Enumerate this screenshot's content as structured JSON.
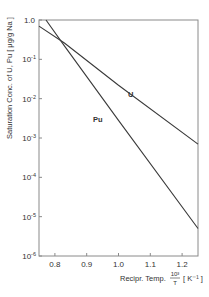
{
  "chart_data": {
    "type": "line",
    "title": "",
    "xlabel": "Recipr. Temp. 10³/T [ K⁻¹ ]",
    "xlabel_parts": {
      "prefix": "Recipr. Temp.",
      "frac_num": "10³",
      "frac_den": "T",
      "unit": "[ K⁻¹ ]"
    },
    "ylabel": "Saturation Conc. of U, Pu [ μg/g Na ]",
    "yscale": "log",
    "xlim": [
      0.75,
      1.25
    ],
    "ylim": [
      1e-06,
      1.0
    ],
    "grid": false,
    "legend": "inline labels",
    "x_ticks": [
      {
        "value": 0.8,
        "label": "0.8"
      },
      {
        "value": 0.9,
        "label": "0.9"
      },
      {
        "value": 1.0,
        "label": "1.0"
      },
      {
        "value": 1.1,
        "label": "1.1"
      },
      {
        "value": 1.2,
        "label": "1.2"
      }
    ],
    "y_ticks": [
      {
        "exp": 0,
        "label": "1.0",
        "base": "1.0",
        "sup": ""
      },
      {
        "exp": -1,
        "label": "10⁻¹",
        "base": "10",
        "sup": "-1"
      },
      {
        "exp": -2,
        "label": "10⁻²",
        "base": "10",
        "sup": "-2"
      },
      {
        "exp": -3,
        "label": "10⁻³",
        "base": "10",
        "sup": "-3"
      },
      {
        "exp": -4,
        "label": "10⁻⁴",
        "base": "10",
        "sup": "-4"
      },
      {
        "exp": -5,
        "label": "10⁻⁵",
        "base": "10",
        "sup": "-5"
      },
      {
        "exp": -6,
        "label": "10⁻⁶",
        "base": "10",
        "sup": "-6"
      }
    ],
    "series": [
      {
        "name": "U",
        "points": [
          {
            "x": 0.75,
            "y": 0.7
          },
          {
            "x": 0.83,
            "y": 0.26
          },
          {
            "x": 1.0,
            "y": 0.022
          },
          {
            "x": 1.25,
            "y": 0.0007
          }
        ],
        "label_pos": {
          "x": 1.03,
          "y": 0.011
        }
      },
      {
        "name": "Pu",
        "points": [
          {
            "x": 0.772,
            "y": 1.0
          },
          {
            "x": 0.83,
            "y": 0.22
          },
          {
            "x": 1.0,
            "y": 0.0028
          },
          {
            "x": 1.25,
            "y": 5e-06
          }
        ],
        "label_pos": {
          "x": 0.92,
          "y": 0.0026
        }
      }
    ],
    "annotations": [
      {
        "text": "U",
        "near_series": "U"
      },
      {
        "text": "Pu",
        "near_series": "Pu"
      }
    ]
  },
  "colors": {
    "line": "#3a3a3a",
    "axis": "#888888",
    "text": "#333333",
    "background": "#ffffff"
  }
}
